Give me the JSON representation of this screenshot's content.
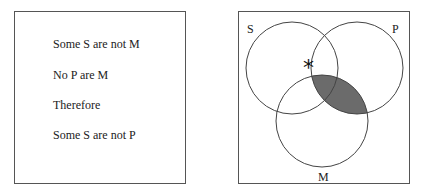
{
  "syllogism": {
    "premise1": "Some S are not M",
    "premise2": "No P are M",
    "connector": "Therefore",
    "conclusion": "Some S are not P"
  },
  "venn": {
    "labels": {
      "s": "S",
      "p": "P",
      "m": "M"
    },
    "marker": "*",
    "shaded_region": "P ∩ M",
    "shade_color": "#6b6b6b",
    "line_color": "#444444"
  }
}
